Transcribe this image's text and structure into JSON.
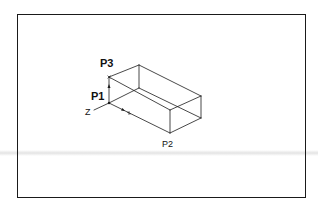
{
  "diagram": {
    "type": "isometric-box-wireframe",
    "labels": {
      "p1": "P1",
      "p2": "P2",
      "p3": "P3",
      "z_axis": "Z",
      "x_axis": "X",
      "y_axis": "Y"
    },
    "colors": {
      "line": "#1a1a1a",
      "background": "#ffffff",
      "frame": "#1a1a1a"
    }
  }
}
